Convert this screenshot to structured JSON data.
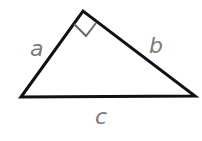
{
  "diagram": {
    "type": "right-triangle",
    "line_color": "#111111",
    "label_color": "#7a7a7a",
    "marker_color": "#666666",
    "vertices": {
      "left": [
        21,
        97
      ],
      "top": [
        83,
        11
      ],
      "right": [
        195,
        96
      ]
    },
    "labels": {
      "a": "a",
      "b": "b",
      "c": "c"
    },
    "right_angle_at": "top"
  }
}
